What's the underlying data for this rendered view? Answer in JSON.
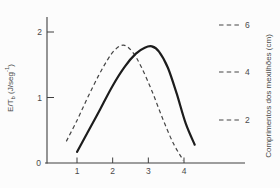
{
  "chart_data": {
    "type": "line",
    "title": "",
    "xlabel": "",
    "ylabel_parts": {
      "base": "E/T",
      "sub": "b",
      "mid": " (J/seg",
      "sup": "-1",
      "end": ")"
    },
    "right_axis_label": "Comprimentos dos mexilhões (cm)",
    "x_ticks": [
      "1",
      "2",
      "3",
      "4"
    ],
    "x_tick_values": [
      1,
      2,
      3,
      4
    ],
    "y_ticks": [
      "2",
      "1"
    ],
    "y_tick_values": [
      2,
      1
    ],
    "origin_label": "0",
    "xlim": [
      0.1,
      5.7
    ],
    "ylim": [
      0,
      2.2
    ],
    "grid": false,
    "legend_position": "right",
    "series": [
      {
        "name": "dashed-curve",
        "style": "dashed",
        "x": [
          0.7,
          1.0,
          1.3,
          1.6,
          1.85,
          2.05,
          2.3,
          2.55,
          2.8,
          3.1,
          3.4,
          3.7,
          3.98
        ],
        "y": [
          0.33,
          0.65,
          1.0,
          1.33,
          1.57,
          1.72,
          1.8,
          1.7,
          1.47,
          1.1,
          0.68,
          0.3,
          0.04
        ]
      },
      {
        "name": "solid-curve",
        "style": "solid",
        "x": [
          1.0,
          1.3,
          1.65,
          2.0,
          2.35,
          2.65,
          2.9,
          3.1,
          3.3,
          3.55,
          3.8,
          4.05,
          4.3
        ],
        "y": [
          0.17,
          0.47,
          0.82,
          1.18,
          1.48,
          1.67,
          1.76,
          1.78,
          1.7,
          1.45,
          1.05,
          0.6,
          0.28
        ]
      }
    ],
    "legend": {
      "entries": [
        {
          "label": "6"
        },
        {
          "label": "4"
        },
        {
          "label": "2"
        }
      ]
    },
    "colors": {
      "solid_curve": "#1c1c1c",
      "dashed_curve": "#454545",
      "axis": "#3f3f3f",
      "text": "#4a4a4a",
      "background": "#fcfcfc"
    }
  }
}
